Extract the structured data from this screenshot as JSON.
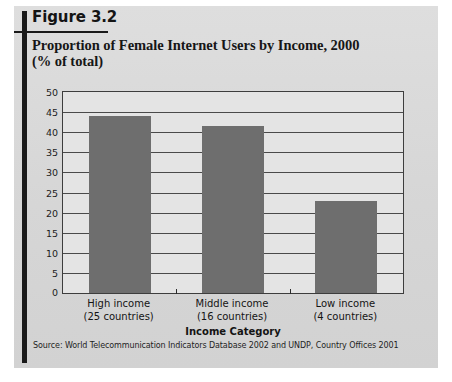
{
  "figure": {
    "label": "Figure 3.2",
    "title": "Proportion of Female Internet Users by Income, 2000 (% of total)",
    "title_line1": "Proportion of Female Internet Users by Income, 2000",
    "title_line2": "(% of total)",
    "source": "Source: World Telecommunication Indicators Database 2002 and UNDP, Country Offices 2001"
  },
  "colors": {
    "bar_fill": "#6e6e6e",
    "plot_background": "#e4e4e4",
    "card_background": "#d9d9d9",
    "gridline": "#4a4a4a",
    "rule": "#1a1a1a"
  },
  "chart_data": {
    "type": "bar",
    "title": "Proportion of Female Internet Users by Income, 2000 (% of total)",
    "xlabel": "Income Category",
    "ylabel": "",
    "categories": [
      "High income",
      "Middle income",
      "Low income"
    ],
    "category_sublabels": [
      "(25 countries)",
      "(16 countries)",
      "(4 countries)"
    ],
    "values": [
      44,
      41.5,
      23
    ],
    "ylim": [
      0,
      50
    ],
    "ytick_step": 5,
    "yticks": [
      50,
      45,
      40,
      35,
      30,
      25,
      20,
      15,
      10,
      5,
      0
    ],
    "grid": true,
    "legend": false
  }
}
